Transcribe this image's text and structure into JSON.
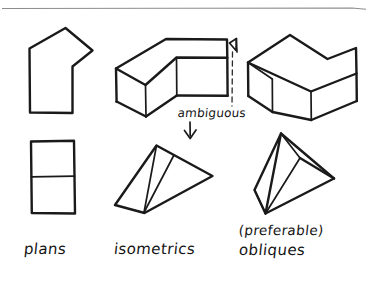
{
  "figure": {
    "title_rule": "horizontal-divider-rule",
    "background_color": "#ffffff",
    "ink_color": "#1a1a1a",
    "rule_color": "#8d8d8d"
  },
  "captions": {
    "column_left": "plans",
    "column_middle": "isometrics",
    "column_right_top": "(preferable)",
    "column_right_bottom": "obliques"
  },
  "annotations": {
    "ambiguous_label": "ambiguous",
    "down_arrow": "arrow-down-icon",
    "corner_arrow": "arrow-up-left-icon",
    "leader_line": "dashed-leader-line"
  },
  "drawings": {
    "plan_bent": {
      "name": "bent-L-plan",
      "column": "plans",
      "row": "top",
      "description": "bent L-shaped building footprint in plan"
    },
    "plan_stacked": {
      "name": "two-rectangle-plan",
      "column": "plans",
      "row": "bottom",
      "description": "two stacked rectangles in plan"
    },
    "iso_bent_block": {
      "name": "isometric-bent-block",
      "column": "isometrics",
      "row": "top",
      "description": "bent extruded block drawn in isometric projection"
    },
    "iso_wedge": {
      "name": "isometric-wedge",
      "column": "isometrics",
      "row": "bottom",
      "description": "flattened wedge prism drawn in isometric projection"
    },
    "obl_bent_block": {
      "name": "oblique-bent-block",
      "column": "obliques",
      "row": "top",
      "description": "bent extruded block drawn in oblique projection"
    },
    "obl_wedge": {
      "name": "oblique-wedge",
      "column": "obliques",
      "row": "bottom",
      "description": "triangular prism drawn in oblique projection"
    }
  }
}
